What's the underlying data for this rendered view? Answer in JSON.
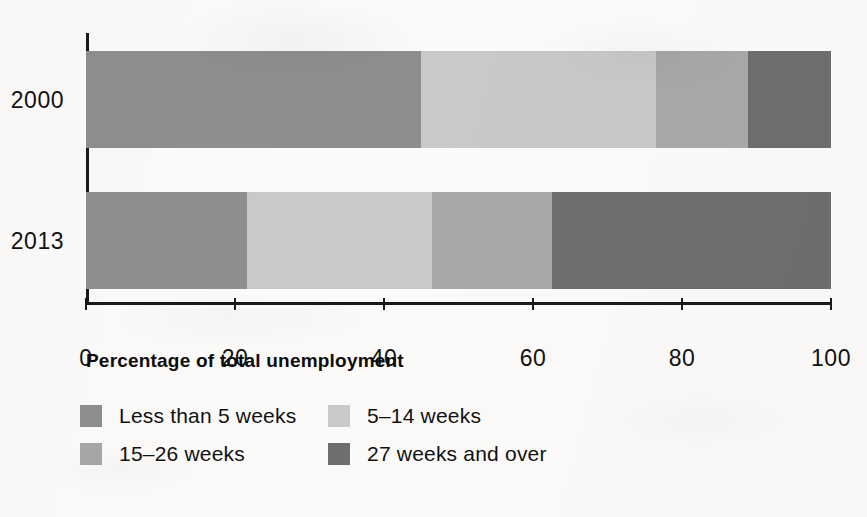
{
  "figure": {
    "background_color": "#fbfaf8"
  },
  "chart_data": {
    "type": "bar",
    "orientation": "horizontal",
    "stacked": true,
    "normalized_percent": true,
    "title": "",
    "subtitle": "",
    "xlabel": "Percentage of total unemployment",
    "ylabel": "",
    "xlim": [
      0,
      100
    ],
    "xticks": [
      0,
      20,
      40,
      60,
      80,
      100
    ],
    "xtick_labels": [
      "0",
      "20",
      "40",
      "60",
      "80",
      "100"
    ],
    "grid": false,
    "legend_position": "bottom-left",
    "categories": [
      "2000",
      "2013"
    ],
    "series": [
      {
        "name": "Less than 5 weeks",
        "color": "#8e8e8e",
        "values": [
          45.0,
          21.6
        ]
      },
      {
        "name": "5–14 weeks",
        "color": "#c9c9c9",
        "values": [
          31.5,
          24.9
        ]
      },
      {
        "name": "15–26 weeks",
        "color": "#a8a8a8",
        "values": [
          12.3,
          16.1
        ]
      },
      {
        "name": "27 weeks and over",
        "color": "#6e6e6e",
        "values": [
          11.2,
          37.4
        ]
      }
    ]
  },
  "axis": {
    "line_color": "#1a1a1a",
    "title": "Percentage of total unemployment",
    "ticks": [
      {
        "value": 0,
        "label": "0"
      },
      {
        "value": 20,
        "label": "20"
      },
      {
        "value": 40,
        "label": "40"
      },
      {
        "value": 60,
        "label": "60"
      },
      {
        "value": 80,
        "label": "80"
      },
      {
        "value": 100,
        "label": "100"
      }
    ]
  },
  "bars": [
    {
      "label": "2000",
      "segments": [
        {
          "name": "Less than 5 weeks",
          "value": 45.0,
          "color": "#8e8e8e"
        },
        {
          "name": "5–14 weeks",
          "value": 31.5,
          "color": "#c9c9c9"
        },
        {
          "name": "15–26 weeks",
          "value": 12.3,
          "color": "#a8a8a8"
        },
        {
          "name": "27 weeks and over",
          "value": 11.2,
          "color": "#6e6e6e"
        }
      ]
    },
    {
      "label": "2013",
      "segments": [
        {
          "name": "Less than 5 weeks",
          "value": 21.6,
          "color": "#8e8e8e"
        },
        {
          "name": "5–14 weeks",
          "value": 24.9,
          "color": "#c9c9c9"
        },
        {
          "name": "15–26 weeks",
          "value": 16.1,
          "color": "#a8a8a8"
        },
        {
          "name": "27 weeks and over",
          "value": 37.4,
          "color": "#6e6e6e"
        }
      ]
    }
  ],
  "legend": {
    "rows": [
      [
        {
          "label": "Less than 5 weeks",
          "color": "#8e8e8e"
        },
        {
          "label": "5–14 weeks",
          "color": "#c9c9c9"
        }
      ],
      [
        {
          "label": "15–26 weeks",
          "color": "#a8a8a8"
        },
        {
          "label": "27 weeks and over",
          "color": "#6e6e6e"
        }
      ]
    ]
  }
}
